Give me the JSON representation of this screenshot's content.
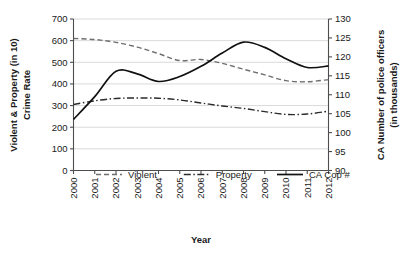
{
  "chart_data": {
    "type": "line",
    "title": "",
    "xlabel": "Year",
    "ylabel": "Violent & Property (in 10) Crime Rate",
    "y2label": "CA Number of police officers (in thousands)",
    "categories": [
      "2000",
      "2001",
      "2002",
      "2003",
      "2004",
      "2005",
      "2006",
      "2007",
      "2008",
      "2009",
      "2010",
      "2011",
      "2012"
    ],
    "ylim": [
      0,
      700
    ],
    "yticks": [
      0,
      100,
      200,
      300,
      400,
      500,
      600,
      700
    ],
    "y2lim": [
      90,
      130
    ],
    "y2ticks": [
      90,
      95,
      100,
      105,
      110,
      115,
      120,
      125,
      130
    ],
    "grid": true,
    "legend_position": "bottom-inside",
    "series": [
      {
        "name": "Violent",
        "axis": "left",
        "style": "dashed",
        "color": "#6e6e6e",
        "values": [
          610,
          605,
          592,
          570,
          540,
          508,
          513,
          495,
          468,
          442,
          415,
          410,
          420
        ]
      },
      {
        "name": "Property",
        "axis": "left",
        "style": "dash-dot",
        "color": "#2b2b2b",
        "values": [
          305,
          322,
          333,
          335,
          334,
          326,
          312,
          298,
          287,
          272,
          259,
          261,
          274
        ]
      },
      {
        "name": "CA Cop #",
        "axis": "right",
        "style": "solid",
        "color": "#111111",
        "values": [
          103.5,
          109.5,
          116.2,
          115.5,
          113.5,
          114.8,
          117.5,
          121.0,
          123.9,
          122.5,
          119.5,
          117.2,
          117.6
        ]
      }
    ]
  },
  "axes": {
    "left_title_line1": "Violent & Property (in 10)",
    "left_title_line2": "Crime Rate",
    "right_title_line1": "CA Number of police officers",
    "right_title_line2": "(in thousands)",
    "x_title": "Year"
  },
  "legend": {
    "items": [
      {
        "label": "Violent",
        "style": "dashed"
      },
      {
        "label": "Property",
        "style": "dash-dot"
      },
      {
        "label": "CA Cop #",
        "style": "solid"
      }
    ]
  },
  "colors": {
    "background": "#ffffff",
    "grid": "#c8c8c8",
    "axis": "#4d4d4d",
    "text": "#1a1a1a",
    "violent": "#6e6e6e",
    "property": "#2b2b2b",
    "cacop": "#111111"
  }
}
